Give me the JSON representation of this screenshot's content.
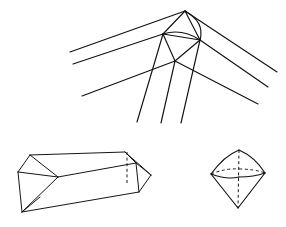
{
  "page": {
    "background_color": "#ffffff",
    "stroke_color": "#111111",
    "width": 286,
    "height": 227
  },
  "figures": [
    {
      "id": "ray-convergence-figure",
      "name": "Converging crystal axes diagram",
      "description": "Apex vertex network with three rays to lower-left, three rays to lower-right, and three rays descending",
      "apex": {
        "x": 185,
        "y": 11
      },
      "vertices": {
        "apex": {
          "x": 185,
          "y": 11
        },
        "left": {
          "x": 163,
          "y": 34
        },
        "right": {
          "x": 200,
          "y": 40
        },
        "center": {
          "x": 175,
          "y": 61
        }
      },
      "left_rays": [
        {
          "x1": 185,
          "y1": 11,
          "x2": 70,
          "y2": 52
        },
        {
          "x1": 163,
          "y1": 34,
          "x2": 73,
          "y2": 64
        },
        {
          "x1": 175,
          "y1": 61,
          "x2": 82,
          "y2": 96
        }
      ],
      "right_rays": [
        {
          "x1": 185,
          "y1": 11,
          "x2": 277,
          "y2": 72
        },
        {
          "x1": 200,
          "y1": 40,
          "x2": 268,
          "y2": 87
        },
        {
          "x1": 175,
          "y1": 61,
          "x2": 258,
          "y2": 104
        }
      ],
      "descending_rays": [
        {
          "x1": 163,
          "y1": 34,
          "x2": 137,
          "y2": 122
        },
        {
          "x1": 175,
          "y1": 61,
          "x2": 161,
          "y2": 123
        },
        {
          "x1": 200,
          "y1": 40,
          "x2": 181,
          "y2": 123
        }
      ],
      "arc": {
        "from_x": 185,
        "from_y": 11,
        "to_x": 200,
        "to_y": 40,
        "bulge": "right"
      }
    },
    {
      "id": "hexagonal-prism-figure",
      "name": "Elongated hexagonal prism with pyramidal terminations",
      "description": "Long prism lying diagonally, pointed cap at left and right, vertical dashed hidden edge near right cap",
      "left_tip": {
        "x": 18,
        "y": 172
      },
      "right_tip": {
        "x": 151,
        "y": 175
      },
      "hidden_edge": {
        "x": 127,
        "y_top": 152,
        "y_bottom": 185
      }
    },
    {
      "id": "dipyramid-figure",
      "name": "Dipyramid crystal",
      "description": "Double pyramid with dashed vertical axis and dashed rear girdle edges",
      "top_apex": {
        "x": 239,
        "y": 150
      },
      "bottom_apex": {
        "x": 238,
        "y": 208
      },
      "left_vertex": {
        "x": 211,
        "y": 174
      },
      "right_vertex": {
        "x": 265,
        "y": 173
      },
      "hidden_axis": {
        "x1": 239,
        "y1": 150,
        "x2": 238,
        "y2": 208
      }
    }
  ]
}
